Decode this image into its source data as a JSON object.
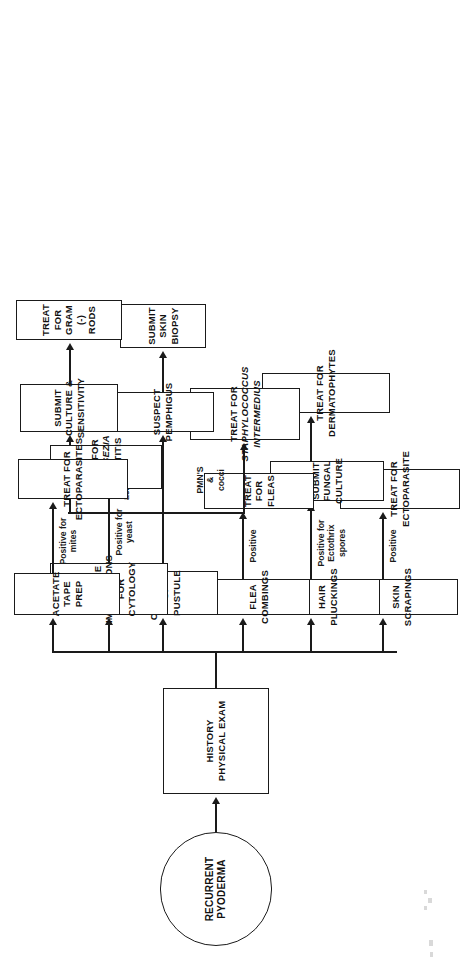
{
  "diagram": {
    "orientation": "rotated-90-ccw",
    "start": {
      "label": "RECURRENT PYODERMA",
      "line1": "RECURRENT",
      "line2": "PYODERMA"
    },
    "history": {
      "label": "HISTORY PHYSICAL EXAM",
      "line1": "HISTORY",
      "line2": "PHYSICAL EXAM"
    },
    "branches": [
      {
        "id": "skin-scrapings",
        "test": "SKIN SCRAPINGS",
        "test_line1": "SKIN SCRAPINGS",
        "edge_label": "Positive",
        "steps": [
          {
            "id": "treat-ectoparasite",
            "line1": "TREAT FOR",
            "line2": "ECTOPARASITE"
          }
        ]
      },
      {
        "id": "hair-pluckings",
        "test": "HAIR PLUCKINGS",
        "test_line1": "HAIR PLUCKINGS",
        "edge_label": "Positive for\nEctothrix spores",
        "steps": [
          {
            "id": "submit-fungal-culture",
            "line1": "SUBMIT FUNGAL",
            "line2": "CULTURE"
          },
          {
            "id": "treat-dermatophytes",
            "line1": "TREAT FOR",
            "line2": "DERMATOPHYTES"
          }
        ]
      },
      {
        "id": "flea-combings",
        "test": "FLEA COMBINGS",
        "test_line1": "FLEA COMBINGS",
        "edge_label": "Positive",
        "steps": [
          {
            "id": "treat-fleas",
            "line1": "TREAT FOR FLEAS",
            "line2": ""
          }
        ]
      },
      {
        "id": "cytology-of-pustule",
        "test": "CYTOLOGY OF PUSTULE",
        "test_line1": "CYTOLOGY OF",
        "test_line2": "PUSTULE",
        "sub_branches": [
          {
            "id": "pmns-cocci",
            "edge_label": "PMN'S\n&\ncocci",
            "steps": [
              {
                "id": "treat-staph",
                "line1": "TREAT FOR",
                "line2": "STAPHYLOCOCCUS",
                "line3": "INTERMEDIUS",
                "italic_lines": [
                  2,
                  3
                ]
              }
            ]
          },
          {
            "id": "pmns-acantholytic",
            "edge_label": "PMN'S\n&\nacantholytic\ncells",
            "steps": [
              {
                "id": "suspect-pemphigus",
                "line1": "SUSPECT",
                "line2": "PEMPHIGUS"
              },
              {
                "id": "submit-skin-biopsy",
                "line1": "SUBMIT",
                "line2": "SKIN",
                "line3": "BIOPSY"
              }
            ]
          },
          {
            "id": "pmns-rods",
            "edge_label": "PMN'S\n&\nrods",
            "steps": [
              {
                "id": "submit-culture-sensitivity",
                "line1": "SUBMIT",
                "line2": "CULTURE &",
                "line3": "SENSITIVITY"
              },
              {
                "id": "treat-gram-neg-rods",
                "line1": "TREAT FOR",
                "line2": "GRAM (-) RODS"
              }
            ]
          }
        ]
      },
      {
        "id": "skin-surface-impressions",
        "test": "SKIN SURFACE IMPRESSIONS FOR CYTOLOGY",
        "test_line1": "SKIN SURFACE",
        "test_line2": "IMPRESSIONS FOR",
        "test_line3": "CYTOLOGY",
        "edge_label": "Positive for yeast",
        "steps": [
          {
            "id": "treat-malassezia",
            "line1": "TREAT FOR",
            "line2": "MALASSEZIA",
            "line3": "DERMATITIS",
            "italic_lines": [
              2
            ]
          }
        ]
      },
      {
        "id": "acetate-tape-prep",
        "test": "ACETATE TAPE PREP",
        "test_line1": "ACETATE",
        "test_line2": "TAPE PREP",
        "edge_label": "Positive for mites",
        "steps": [
          {
            "id": "treat-ectoparasites",
            "line1": "TREAT FOR",
            "line2": "ECTOPARASITES"
          }
        ]
      }
    ],
    "colors": {
      "stroke": "#1a1a1a",
      "background": "#ffffff",
      "text": "#111111"
    }
  }
}
